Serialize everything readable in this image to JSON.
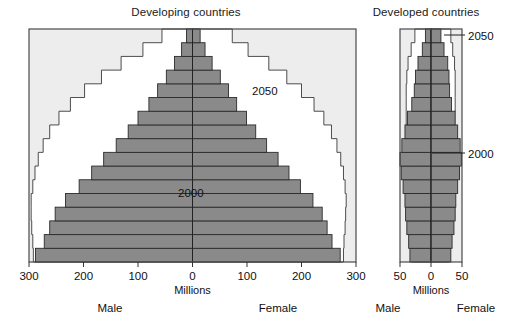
{
  "figure": {
    "background": "#ffffff",
    "bar_fill": "#8a8a8a",
    "bar_stroke": "#2b2b2b",
    "plot_bg": "#ededed",
    "frame_stroke": "#4a4a4a",
    "outline_2050_stroke": "#3a3a3a",
    "outline_2050_fill": "#ffffff"
  },
  "panels": [
    {
      "id": "developing",
      "title": "Developing countries",
      "axis_label": "Millions",
      "left_label": "Male",
      "right_label": "Female",
      "ticks": [
        300,
        200,
        100,
        0,
        100,
        200,
        300
      ],
      "tick_labels": [
        "300",
        "200",
        "100",
        "0",
        "100",
        "200",
        "300"
      ],
      "xlim": 300,
      "annotations": [
        {
          "text": "2050",
          "series": "2050"
        },
        {
          "text": "2000",
          "series": "2000"
        }
      ]
    },
    {
      "id": "developed",
      "title": "Developed countries",
      "axis_label": "Millions",
      "left_label": "Male",
      "right_label": "Female",
      "ticks": [
        50,
        0,
        50
      ],
      "tick_labels": [
        "50",
        "0",
        "50"
      ],
      "xlim": 50,
      "annotations": [
        {
          "text": "2050",
          "series": "2050"
        },
        {
          "text": "2000",
          "series": "2000"
        }
      ]
    }
  ],
  "chart_data": {
    "type": "bar",
    "chart_kind": "population-pyramid",
    "xlabel": "Millions",
    "ylabel": "Age group",
    "grid": false,
    "legend_position": "inline-annotation",
    "series_names": [
      "2000",
      "2050"
    ],
    "age_groups": [
      "0-4",
      "5-9",
      "10-14",
      "15-19",
      "20-24",
      "25-29",
      "30-34",
      "35-39",
      "40-44",
      "45-49",
      "50-54",
      "55-59",
      "60-64",
      "65-69",
      "70-74",
      "75-79",
      "80+"
    ],
    "charts": [
      {
        "panel": "developing",
        "title": "Developing countries",
        "xlabel": "Millions",
        "xlim": [
          -300,
          300
        ],
        "tick_labels": [
          "300",
          "200",
          "100",
          "0",
          "100",
          "200",
          "300"
        ],
        "left_label": "Male",
        "right_label": "Female",
        "series": [
          {
            "name": "2000",
            "male": [
              288,
              272,
              262,
              252,
              233,
              208,
              185,
              163,
              140,
              118,
              100,
              80,
              64,
              48,
              33,
              20,
              11
            ],
            "female": [
              271,
              256,
              247,
              238,
              221,
              198,
              177,
              157,
              136,
              116,
              99,
              81,
              66,
              51,
              36,
              23,
              14
            ]
          },
          {
            "name": "2050",
            "male": [
              292,
              293,
              295,
              296,
              296,
              293,
              289,
              283,
              274,
              262,
              245,
              224,
              198,
              167,
              131,
              91,
              56
            ],
            "female": [
              277,
              278,
              280,
              281,
              282,
              280,
              277,
              272,
              265,
              255,
              241,
              223,
              200,
              173,
              140,
              102,
              73
            ]
          }
        ]
      },
      {
        "panel": "developed",
        "title": "Developed countries",
        "xlabel": "Millions",
        "xlim": [
          -50,
          50
        ],
        "tick_labels": [
          "50",
          "0",
          "50"
        ],
        "left_label": "Male",
        "right_label": "Female",
        "series": [
          {
            "name": "2000",
            "male": [
              34,
              36,
              39,
              41,
              42,
              45,
              48,
              50,
              47,
              42,
              38,
              31,
              27,
              25,
              21,
              14,
              9
            ],
            "female": [
              32,
              34,
              37,
              39,
              40,
              43,
              46,
              49,
              47,
              43,
              39,
              33,
              30,
              29,
              27,
              21,
              16
            ]
          },
          {
            "name": "2050",
            "male": [
              30,
              31,
              32,
              33,
              34,
              35,
              36,
              37,
              38,
              39,
              40,
              40,
              40,
              39,
              37,
              32,
              26
            ],
            "female": [
              29,
              30,
              31,
              32,
              32,
              33,
              34,
              35,
              36,
              37,
              38,
              39,
              39,
              39,
              38,
              35,
              32
            ]
          }
        ]
      }
    ]
  }
}
